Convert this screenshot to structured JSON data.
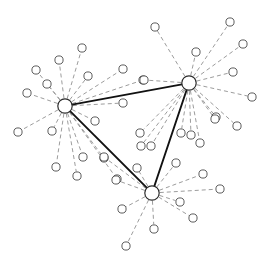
{
  "figure": {
    "kind": "node-link-network-diagram",
    "background_color": "#ffffff",
    "width": 268,
    "height": 265
  },
  "style": {
    "hub_stroke_color": "#2b2b2b",
    "hub_fill_color": "#ffffff",
    "hub_stroke_width": 1.2,
    "hub_radius": 7.2,
    "leaf_stroke_color": "#4a4a4a",
    "leaf_fill_color": "#ffffff",
    "leaf_stroke_width": 0.9,
    "leaf_radius": 4.1,
    "hub_edge_color": "#111111",
    "hub_edge_width": 1.9,
    "leaf_edge_color": "#8a8a8a",
    "leaf_edge_width": 0.85,
    "leaf_edge_dash": "4 3"
  },
  "chart_data": {
    "type": "scatter",
    "title": "",
    "xlabel": "",
    "ylabel": "",
    "xlim": [
      0,
      268
    ],
    "ylim": [
      0,
      265
    ],
    "grid": false,
    "legend": null,
    "hubs": [
      {
        "id": "hub-left",
        "label": "",
        "x": 65,
        "y": 106,
        "degree": 17
      },
      {
        "id": "hub-top-right",
        "label": "",
        "x": 189,
        "y": 83,
        "degree": 20
      },
      {
        "id": "hub-bottom",
        "label": "",
        "x": 152,
        "y": 193,
        "degree": 16
      }
    ],
    "hub_edges": [
      {
        "source": "hub-left",
        "target": "hub-top-right"
      },
      {
        "source": "hub-top-right",
        "target": "hub-bottom"
      },
      {
        "source": "hub-bottom",
        "target": "hub-left"
      }
    ],
    "leaves": [
      {
        "id": "L01",
        "hub": "hub-left",
        "x": 82,
        "y": 48
      },
      {
        "id": "L02",
        "hub": "hub-left",
        "x": 59,
        "y": 60
      },
      {
        "id": "L03",
        "hub": "hub-left",
        "x": 88,
        "y": 76
      },
      {
        "id": "L04",
        "hub": "hub-left",
        "x": 47,
        "y": 84
      },
      {
        "id": "L05",
        "hub": "hub-left",
        "x": 27,
        "y": 93
      },
      {
        "id": "L06",
        "hub": "hub-left",
        "x": 18,
        "y": 132
      },
      {
        "id": "L07",
        "hub": "hub-left",
        "x": 52,
        "y": 131
      },
      {
        "id": "L08",
        "hub": "hub-left",
        "x": 56,
        "y": 167
      },
      {
        "id": "L09",
        "hub": "hub-left",
        "x": 83,
        "y": 157
      },
      {
        "id": "L10",
        "hub": "hub-left",
        "x": 104,
        "y": 158
      },
      {
        "id": "L11",
        "hub": "hub-left",
        "x": 95,
        "y": 121
      },
      {
        "id": "L12",
        "hub": "hub-left",
        "x": 123,
        "y": 103
      },
      {
        "id": "L13",
        "hub": "hub-left",
        "x": 143,
        "y": 80
      },
      {
        "id": "L14",
        "hub": "hub-left",
        "x": 123,
        "y": 69
      },
      {
        "id": "L15",
        "hub": "hub-left",
        "x": 77,
        "y": 176
      },
      {
        "id": "L16",
        "hub": "hub-left",
        "x": 117,
        "y": 179
      },
      {
        "id": "L17",
        "hub": "hub-left",
        "x": 36,
        "y": 70
      },
      {
        "id": "R01",
        "hub": "hub-top-right",
        "x": 155,
        "y": 27
      },
      {
        "id": "R02",
        "hub": "hub-top-right",
        "x": 196,
        "y": 52
      },
      {
        "id": "R03",
        "hub": "hub-top-right",
        "x": 230,
        "y": 22
      },
      {
        "id": "R04",
        "hub": "hub-top-right",
        "x": 243,
        "y": 44
      },
      {
        "id": "R05",
        "hub": "hub-top-right",
        "x": 233,
        "y": 72
      },
      {
        "id": "R06",
        "hub": "hub-top-right",
        "x": 252,
        "y": 97
      },
      {
        "id": "R07",
        "hub": "hub-top-right",
        "x": 216,
        "y": 117
      },
      {
        "id": "R08",
        "hub": "hub-top-right",
        "x": 237,
        "y": 126
      },
      {
        "id": "R09",
        "hub": "hub-top-right",
        "x": 200,
        "y": 143
      },
      {
        "id": "R10",
        "hub": "hub-top-right",
        "x": 191,
        "y": 135
      },
      {
        "id": "R11",
        "hub": "hub-top-right",
        "x": 181,
        "y": 133
      },
      {
        "id": "R12",
        "hub": "hub-top-right",
        "x": 151,
        "y": 146
      },
      {
        "id": "R13",
        "hub": "hub-top-right",
        "x": 141,
        "y": 146
      },
      {
        "id": "R14",
        "hub": "hub-top-right",
        "x": 140,
        "y": 133
      },
      {
        "id": "R15",
        "hub": "hub-top-right",
        "x": 144,
        "y": 80
      },
      {
        "id": "R16",
        "hub": "hub-top-right",
        "x": 215,
        "y": 119
      },
      {
        "id": "B01",
        "hub": "hub-bottom",
        "x": 104,
        "y": 157
      },
      {
        "id": "B02",
        "hub": "hub-bottom",
        "x": 116,
        "y": 180
      },
      {
        "id": "B03",
        "hub": "hub-bottom",
        "x": 122,
        "y": 209
      },
      {
        "id": "B04",
        "hub": "hub-bottom",
        "x": 126,
        "y": 246
      },
      {
        "id": "B05",
        "hub": "hub-bottom",
        "x": 154,
        "y": 229
      },
      {
        "id": "B06",
        "hub": "hub-bottom",
        "x": 193,
        "y": 218
      },
      {
        "id": "B07",
        "hub": "hub-bottom",
        "x": 180,
        "y": 202
      },
      {
        "id": "B08",
        "hub": "hub-bottom",
        "x": 220,
        "y": 189
      },
      {
        "id": "B09",
        "hub": "hub-bottom",
        "x": 203,
        "y": 174
      },
      {
        "id": "B10",
        "hub": "hub-bottom",
        "x": 176,
        "y": 163
      },
      {
        "id": "B11",
        "hub": "hub-bottom",
        "x": 137,
        "y": 168
      }
    ],
    "counts": {
      "hub_count": 3,
      "leaf_count": 44,
      "hub_edge_count": 3
    }
  }
}
